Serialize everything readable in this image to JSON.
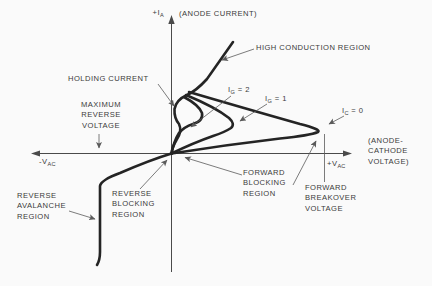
{
  "figure_title": "SCR anode characteristic curves",
  "colors": {
    "background": "#fafafa",
    "line": "#242424",
    "text": "#3a3a3a",
    "leader": "#5a5a5a",
    "axis": "#4a4a4a"
  },
  "axes": {
    "vertical": {
      "pre": "+I",
      "sub": "A",
      "caption": "(ANODE CURRENT)"
    },
    "horizontal_negative": {
      "pre": "-V",
      "sub": "AC"
    },
    "horizontal_positive": {
      "pre": "+V",
      "sub": "AC"
    },
    "horizontal_caption": {
      "lines": [
        "(ANODE-",
        "CATHODE",
        "VOLTAGE)"
      ]
    }
  },
  "labels": {
    "high_conduction_region": "HIGH CONDUCTION REGION",
    "holding_current": "HOLDING CURRENT",
    "maximum_reverse_voltage": {
      "lines": [
        "MAXIMUM",
        "REVERSE",
        "VOLTAGE"
      ]
    },
    "gate_current_2": {
      "pre": "I",
      "sub": "G",
      "post": " = 2"
    },
    "gate_current_1": {
      "pre": "I",
      "sub": "G",
      "post": " = 1"
    },
    "cathode_current_0": {
      "pre": "I",
      "sub": "C",
      "post": " = 0"
    },
    "reverse_avalanche_region": {
      "lines": [
        "REVERSE",
        "AVALANCHE",
        "REGION"
      ]
    },
    "reverse_blocking_region": {
      "lines": [
        "REVERSE",
        "BLOCKING",
        "REGION"
      ]
    },
    "forward_blocking_region": {
      "lines": [
        "FORWARD",
        "BLOCKING",
        "REGION"
      ]
    },
    "forward_breakover_voltage": {
      "lines": [
        "FORWARD",
        "BREAKOVER",
        "VOLTAGE"
      ]
    }
  },
  "curves": [
    {
      "name": "high-conduction-and-holding-knee"
    },
    {
      "name": "loop-gate-current-2"
    },
    {
      "name": "loop-gate-current-1"
    },
    {
      "name": "loop-gate-current-0-forward-breakover"
    },
    {
      "name": "reverse-avalanche-branch"
    }
  ]
}
